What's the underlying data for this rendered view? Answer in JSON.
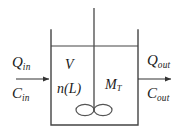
{
  "figure": {
    "type": "process-diagram",
    "width": 187,
    "height": 139,
    "background_color": "#ffffff",
    "line_color": "#333333",
    "text_color": "#1a1a1a"
  },
  "vessel": {
    "left_wall_x": 51,
    "right_wall_x": 138,
    "top_y": 30,
    "bottom_y": 125,
    "liquid_surface_y": 46
  },
  "agitator": {
    "shaft_x": 94,
    "shaft_top_y": 8,
    "shaft_bottom_y": 112,
    "blade_left_cx": 85,
    "blade_right_cx": 103,
    "blade_cy": 110,
    "blade_rx": 9,
    "blade_ry": 5.5
  },
  "streams": {
    "inlet": {
      "arrow_y": 79,
      "arrow_start_x": 16,
      "arrow_end_x": 51,
      "flow_symbol": "Q",
      "flow_subscript": "in",
      "conc_symbol": "C",
      "conc_subscript": "in"
    },
    "outlet": {
      "arrow_y": 79,
      "arrow_start_x": 138,
      "arrow_end_x": 173,
      "flow_symbol": "Q",
      "flow_subscript": "out",
      "conc_symbol": "C",
      "conc_subscript": "out"
    }
  },
  "inner_labels": {
    "volume": "V",
    "population_density": "n(L)",
    "mass_symbol": "M",
    "mass_subscript": "T"
  }
}
